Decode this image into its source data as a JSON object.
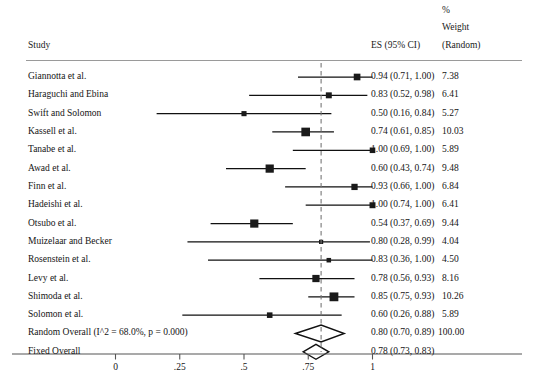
{
  "header": {
    "study_label": "Study",
    "es_label": "ES (95% CI)",
    "pct_label": "%",
    "weight_label": "Weight",
    "random_label": "(Random)"
  },
  "chart_data": {
    "type": "forest",
    "title": "",
    "xlabel": "",
    "ylabel": "",
    "xlim": [
      0,
      1.25
    ],
    "grid": false,
    "legend": "none",
    "axis_ticks": [
      0,
      0.25,
      0.5,
      0.75,
      1
    ],
    "axis_tick_labels": [
      "0",
      ".25",
      ".5",
      ".75",
      "1"
    ],
    "reference_line": 0.8,
    "columns": [
      "Study",
      "ES (95% CI)",
      "% Weight (Random)"
    ],
    "rows": [
      {
        "study": "Giannotta et al.",
        "es": 0.94,
        "lo": 0.71,
        "hi": 1.0,
        "weight": 7.38,
        "es_text": "0.94 (0.71, 1.00)",
        "weight_text": "7.38"
      },
      {
        "study": "Haraguchi and Ebina",
        "es": 0.83,
        "lo": 0.52,
        "hi": 0.98,
        "weight": 6.41,
        "es_text": "0.83 (0.52, 0.98)",
        "weight_text": "6.41"
      },
      {
        "study": "Swift and Solomon",
        "es": 0.5,
        "lo": 0.16,
        "hi": 0.84,
        "weight": 5.27,
        "es_text": "0.50 (0.16, 0.84)",
        "weight_text": "5.27"
      },
      {
        "study": "Kassell et al.",
        "es": 0.74,
        "lo": 0.61,
        "hi": 0.85,
        "weight": 10.03,
        "es_text": "0.74 (0.61, 0.85)",
        "weight_text": "10.03"
      },
      {
        "study": "Tanabe et al.",
        "es": 1.0,
        "lo": 0.69,
        "hi": 1.0,
        "weight": 5.89,
        "es_text": "1.00 (0.69, 1.00)",
        "weight_text": "5.89"
      },
      {
        "study": "Awad et al.",
        "es": 0.6,
        "lo": 0.43,
        "hi": 0.74,
        "weight": 9.48,
        "es_text": "0.60 (0.43, 0.74)",
        "weight_text": "9.48"
      },
      {
        "study": "Finn et al.",
        "es": 0.93,
        "lo": 0.66,
        "hi": 1.0,
        "weight": 6.84,
        "es_text": "0.93 (0.66, 1.00)",
        "weight_text": "6.84"
      },
      {
        "study": "Hadeishi et al.",
        "es": 1.0,
        "lo": 0.74,
        "hi": 1.0,
        "weight": 6.41,
        "es_text": "1.00 (0.74, 1.00)",
        "weight_text": "6.41"
      },
      {
        "study": "Otsubo et al.",
        "es": 0.54,
        "lo": 0.37,
        "hi": 0.69,
        "weight": 9.44,
        "es_text": "0.54 (0.37, 0.69)",
        "weight_text": "9.44"
      },
      {
        "study": "Muizelaar and Becker",
        "es": 0.8,
        "lo": 0.28,
        "hi": 0.99,
        "weight": 4.04,
        "es_text": "0.80 (0.28, 0.99)",
        "weight_text": "4.04"
      },
      {
        "study": "Rosenstein et al.",
        "es": 0.83,
        "lo": 0.36,
        "hi": 1.0,
        "weight": 4.5,
        "es_text": "0.83 (0.36, 1.00)",
        "weight_text": "4.50"
      },
      {
        "study": "Levy et al.",
        "es": 0.78,
        "lo": 0.56,
        "hi": 0.93,
        "weight": 8.16,
        "es_text": "0.78 (0.56, 0.93)",
        "weight_text": "8.16"
      },
      {
        "study": "Shimoda et al.",
        "es": 0.85,
        "lo": 0.75,
        "hi": 0.93,
        "weight": 10.26,
        "es_text": "0.85 (0.75, 0.93)",
        "weight_text": "10.26"
      },
      {
        "study": "Solomon et al.",
        "es": 0.6,
        "lo": 0.26,
        "hi": 0.88,
        "weight": 5.89,
        "es_text": "0.60 (0.26, 0.88)",
        "weight_text": "5.89"
      }
    ],
    "summaries": [
      {
        "study": "Random Overall  (I^2 = 68.0%, p = 0.000)",
        "es": 0.8,
        "lo": 0.7,
        "hi": 0.89,
        "es_text": "0.80 (0.70, 0.89)",
        "weight_text": "100.00"
      },
      {
        "study": "Fixed Overall",
        "es": 0.78,
        "lo": 0.73,
        "hi": 0.83,
        "es_text": "0.78 (0.73, 0.83)",
        "weight_text": ""
      }
    ]
  },
  "colors": {
    "marker": "#1a1a1a",
    "line": "#111111",
    "axis": "#555555",
    "rule": "#9a9a9a",
    "refline": "#777777"
  }
}
